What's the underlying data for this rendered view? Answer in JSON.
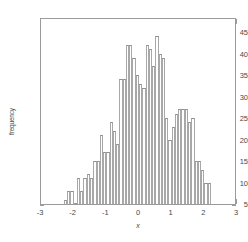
{
  "chart_data": {
    "type": "bar",
    "subtype": "histogram",
    "title": "",
    "subtitle": "",
    "xlabel": "x",
    "ylabel": "frequency",
    "xlim": [
      -3,
      3
    ],
    "ylim": [
      5,
      48.5
    ],
    "grid": false,
    "legend": null,
    "legend_position": "none",
    "bar_color": "#ffffff",
    "bar_edge_color": "#a8a8a8",
    "axis_color": "#9b9b9b",
    "xticks": [
      -3,
      -2,
      -1,
      0,
      1,
      2,
      3
    ],
    "xtick_labels": [
      "-3",
      "-2",
      "-1",
      "0",
      "1",
      "2",
      "3"
    ],
    "yticks": [
      5,
      10,
      15,
      20,
      25,
      30,
      35,
      40,
      45
    ],
    "ytick_labels": [
      "5",
      "10",
      "15",
      "20",
      "25",
      "30",
      "35",
      "40",
      "45"
    ],
    "bin_width": 0.1,
    "bin_centers": [
      -2.25,
      -2.15,
      -2.05,
      -1.95,
      -1.85,
      -1.75,
      -1.65,
      -1.55,
      -1.45,
      -1.35,
      -1.25,
      -1.15,
      -1.05,
      -0.95,
      -0.85,
      -0.75,
      -0.65,
      -0.55,
      -0.45,
      -0.35,
      -0.25,
      -0.15,
      -0.05,
      0.05,
      0.15,
      0.25,
      0.35,
      0.45,
      0.55,
      0.65,
      0.75,
      0.85,
      0.95,
      1.05,
      1.15,
      1.25,
      1.35,
      1.45,
      1.55,
      1.65,
      1.75,
      1.85,
      1.95,
      2.05,
      2.15
    ],
    "values": [
      6,
      8,
      8,
      5,
      11,
      8,
      11,
      12,
      11,
      15,
      15,
      21,
      17,
      17,
      24,
      22,
      19,
      34,
      34,
      42,
      42,
      39,
      35,
      33,
      32,
      42,
      41,
      37,
      44,
      40,
      39,
      25,
      20,
      23,
      26,
      27,
      27,
      27,
      24,
      25,
      15,
      15,
      13,
      10,
      10
    ],
    "categories": [
      "-2.25",
      "-2.15",
      "-2.05",
      "-1.95",
      "-1.85",
      "-1.75",
      "-1.65",
      "-1.55",
      "-1.45",
      "-1.35",
      "-1.25",
      "-1.15",
      "-1.05",
      "-0.95",
      "-0.85",
      "-0.75",
      "-0.65",
      "-0.55",
      "-0.45",
      "-0.35",
      "-0.25",
      "-0.15",
      "-0.05",
      "0.05",
      "0.15",
      "0.25",
      "0.35",
      "0.45",
      "0.55",
      "0.65",
      "0.75",
      "0.85",
      "0.95",
      "1.05",
      "1.15",
      "1.25",
      "1.35",
      "1.45",
      "1.55",
      "1.65",
      "1.75",
      "1.85",
      "1.95",
      "2.05",
      "2.15"
    ]
  }
}
